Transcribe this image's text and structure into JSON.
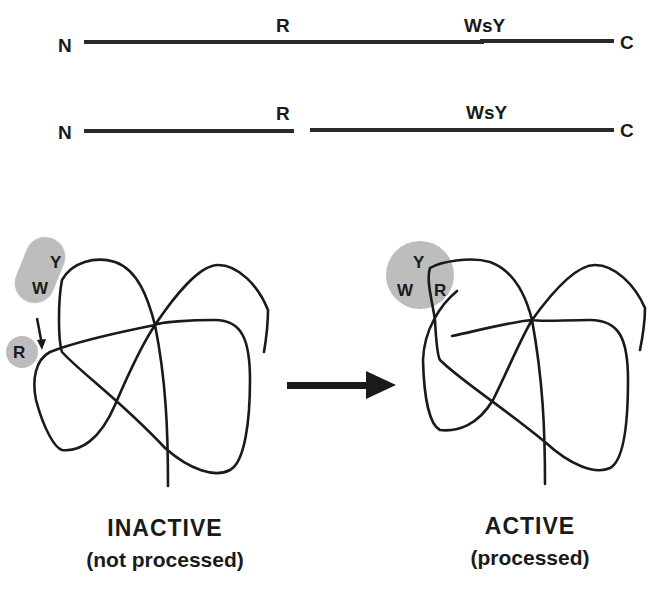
{
  "linear_chains": [
    {
      "name": "uncleaved",
      "n_label": "N",
      "c_label": "C",
      "site_r": "R",
      "site_wsy": "WsY"
    },
    {
      "name": "cleaved",
      "n_label": "N",
      "c_label": "C",
      "site_r": "R",
      "site_wsy": "WsY"
    }
  ],
  "folded": {
    "inactive": {
      "title": "INACTIVE",
      "subtitle": "(not processed)",
      "blob_labels": {
        "y": "Y",
        "w": "W",
        "r": "R"
      }
    },
    "active": {
      "title": "ACTIVE",
      "subtitle": "(processed)",
      "blob_labels": {
        "y": "Y",
        "w": "W",
        "r": "R"
      }
    }
  },
  "colors": {
    "line": "#1a1a1a",
    "blob": "#b8b8b8"
  }
}
